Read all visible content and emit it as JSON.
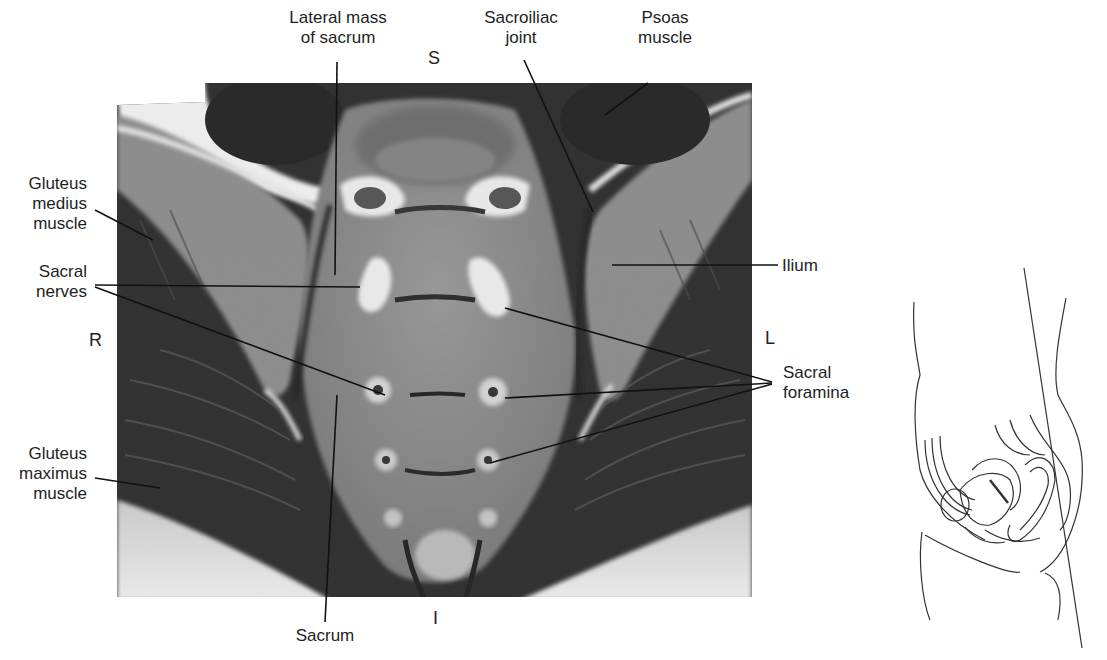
{
  "figure": {
    "type": "Coronal T1-weighted MRI of the sacrum with orientation line drawing",
    "orientation": {
      "superior": "S",
      "inferior": "I",
      "right": "R",
      "left": "L"
    },
    "labels": {
      "lateral_mass": [
        "Lateral mass",
        "of sacrum"
      ],
      "sacroiliac_joint": [
        "Sacroiliac",
        "joint"
      ],
      "psoas": [
        "Psoas",
        "muscle"
      ],
      "gluteus_medius": [
        "Gluteus",
        "medius",
        "muscle"
      ],
      "sacral_nerves": [
        "Sacral",
        "nerves"
      ],
      "ilium": [
        "Ilium"
      ],
      "sacral_foramina": [
        "Sacral",
        "foramina"
      ],
      "gluteus_maximus": [
        "Gluteus",
        "maximus",
        "muscle"
      ],
      "sacrum": [
        "Sacrum"
      ]
    },
    "colors": {
      "background": "#ffffff",
      "mri_dark": "#2b2b2b",
      "mri_mid": "#7a7a7a",
      "mri_light": "#bdbdbd",
      "mri_bright": "#f2f2f2",
      "leader_line": "#111111",
      "drawing_line": "#333333"
    }
  }
}
